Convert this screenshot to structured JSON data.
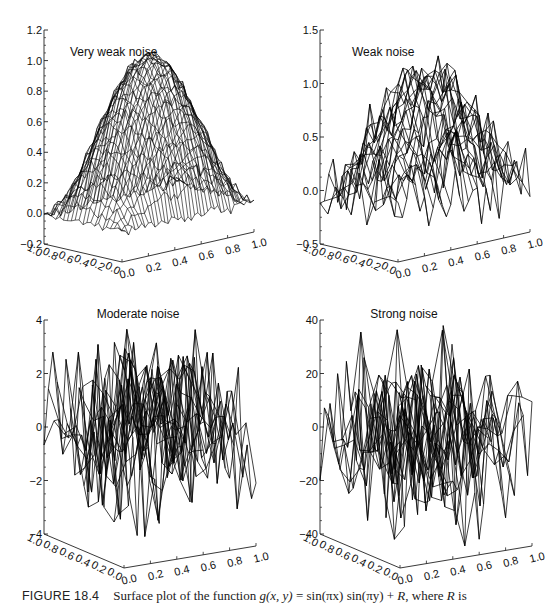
{
  "figure": {
    "caption_label": "FIGURE 18.4",
    "caption_text": "Surface plot of the function g(x, y) = sin(πx) sin(πy) + R, where R is",
    "caption_parts": {
      "prefix": "Surface plot of the function ",
      "func": "g(x, y)",
      "eq": " = sin(πx) sin(πy) + ",
      "r": "R",
      "suffix": ", where ",
      "r2": "R",
      "tail": " is"
    }
  },
  "chart_data": [
    {
      "type": "surface",
      "title": "Very weak noise",
      "function": "sin(pi*x)*sin(pi*y) + R",
      "noise_amplitude": 0.02,
      "zlim": [
        -0.2,
        1.2
      ],
      "z_ticks": [
        "1.2",
        "1.0",
        "0.8",
        "0.6",
        "0.4",
        "0.2",
        "0.0",
        "-0.2"
      ],
      "z_tick_values": [
        1.2,
        1.0,
        0.8,
        0.6,
        0.4,
        0.2,
        0.0,
        -0.2
      ],
      "x_ticks": [
        "0.0",
        "0.2",
        "0.4",
        "0.6",
        "0.8",
        "1.0"
      ],
      "y_ticks": [
        "0.0",
        "0.2",
        "0.4",
        "0.6",
        "0.8",
        "1.0"
      ],
      "xlim": [
        0,
        1
      ],
      "ylim": [
        0,
        1
      ],
      "grid_x": 20,
      "grid_y": 40,
      "peak": 0.97
    },
    {
      "type": "surface",
      "title": "Weak noise",
      "function": "sin(pi*x)*sin(pi*y) + R",
      "noise_amplitude": 0.15,
      "zlim": [
        -0.5,
        1.5
      ],
      "z_ticks": [
        "1.5",
        "1.0",
        "0.5",
        "0.0",
        "-0.5"
      ],
      "z_tick_values": [
        1.5,
        1.0,
        0.5,
        0.0,
        -0.5
      ],
      "x_ticks": [
        "0.0",
        "0.2",
        "0.4",
        "0.6",
        "0.8",
        "1.0"
      ],
      "y_ticks": [
        "0.0",
        "0.2",
        "0.4",
        "0.6",
        "0.8",
        "1.0"
      ],
      "xlim": [
        0,
        1
      ],
      "ylim": [
        0,
        1
      ],
      "grid_x": 10,
      "grid_y": 30,
      "peak": 1.2
    },
    {
      "type": "surface",
      "title": "Moderate noise",
      "function": "sin(pi*x)*sin(pi*y) + R",
      "noise_amplitude": 1.5,
      "zlim": [
        -4,
        4
      ],
      "z_ticks": [
        "4",
        "2",
        "0",
        "-2",
        "-4"
      ],
      "z_tick_values": [
        4,
        2,
        0,
        -2,
        -4
      ],
      "x_ticks": [
        "0.0",
        "0.2",
        "0.4",
        "0.6",
        "0.8",
        "1.0"
      ],
      "y_ticks": [
        "0.0",
        "0.2",
        "0.4",
        "0.6",
        "0.8",
        "1.0"
      ],
      "xlim": [
        0,
        1
      ],
      "ylim": [
        0,
        1
      ],
      "grid_x": 8,
      "grid_y": 30,
      "peak": 3.5
    },
    {
      "type": "surface",
      "title": "Strong noise",
      "function": "sin(pi*x)*sin(pi*y) + R",
      "noise_amplitude": 15,
      "zlim": [
        -40,
        40
      ],
      "z_ticks": [
        "40",
        "20",
        "0",
        "-20",
        "-40"
      ],
      "z_tick_values": [
        40,
        20,
        0,
        -20,
        -40
      ],
      "x_ticks": [
        "0.0",
        "0.2",
        "0.4",
        "0.6",
        "0.8",
        "1.0"
      ],
      "y_ticks": [
        "0.0",
        "0.2",
        "0.4",
        "0.6",
        "0.8",
        "1.0"
      ],
      "xlim": [
        0,
        1
      ],
      "ylim": [
        0,
        1
      ],
      "grid_x": 8,
      "grid_y": 30,
      "peak": 28
    }
  ],
  "panels": [
    {
      "title": "Very weak noise",
      "origin": [
        0,
        0
      ],
      "title_pos": [
        70,
        56
      ],
      "title_anchor": "start"
    },
    {
      "title": "Weak noise",
      "origin": [
        276,
        0
      ],
      "title_pos": [
        76,
        56
      ],
      "title_anchor": "start"
    },
    {
      "title": "Moderate noise",
      "origin": [
        0,
        288
      ],
      "title_pos": [
        138,
        30
      ],
      "title_anchor": "middle"
    },
    {
      "title": "Strong noise",
      "origin": [
        276,
        288
      ],
      "title_pos": [
        128,
        30
      ],
      "title_anchor": "middle"
    }
  ]
}
